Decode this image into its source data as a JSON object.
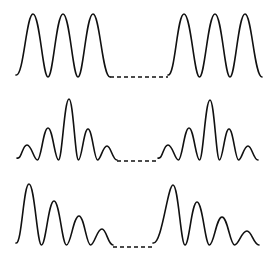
{
  "diagram": {
    "colors": {
      "stroke": "#111111",
      "background": "#ffffff"
    },
    "rows": [
      {
        "name": "uniform-peaks",
        "baseline": 77,
        "groups": [
          {
            "start": 16,
            "end": 110,
            "peaks": [
              [
                33,
                14
              ],
              [
                63,
                14
              ],
              [
                93,
                14
              ]
            ]
          },
          {
            "start": 168,
            "end": 262,
            "peaks": [
              [
                184,
                14
              ],
              [
                215,
                14
              ],
              [
                245,
                14
              ]
            ]
          }
        ],
        "gap": {
          "x1": 110,
          "x2": 168,
          "y": 77
        }
      },
      {
        "name": "symmetric-peaks",
        "baseline": 160,
        "groups": [
          {
            "start": 17,
            "end": 117,
            "peaks": [
              [
                27,
                145
              ],
              [
                48,
                128
              ],
              [
                69,
                99
              ],
              [
                88,
                129
              ],
              [
                107,
                146
              ]
            ]
          },
          {
            "start": 158,
            "end": 258,
            "peaks": [
              [
                168,
                145
              ],
              [
                189,
                128
              ],
              [
                210,
                100
              ],
              [
                229,
                129
              ],
              [
                248,
                146
              ]
            ]
          }
        ],
        "gap": {
          "x1": 117,
          "x2": 158,
          "y": 161
        }
      },
      {
        "name": "decaying-peaks",
        "baseline": 245,
        "groups": [
          {
            "start": 16,
            "end": 113,
            "peaks": [
              [
                29,
                184
              ],
              [
                54,
                201
              ],
              [
                79,
                216
              ],
              [
                102,
                229
              ]
            ]
          },
          {
            "start": 153,
            "end": 259,
            "peaks": [
              [
                173,
                185
              ],
              [
                197,
                202
              ],
              [
                222,
                217
              ],
              [
                247,
                231
              ]
            ]
          }
        ],
        "gap": {
          "x1": 113,
          "x2": 153,
          "y": 247
        }
      }
    ]
  }
}
